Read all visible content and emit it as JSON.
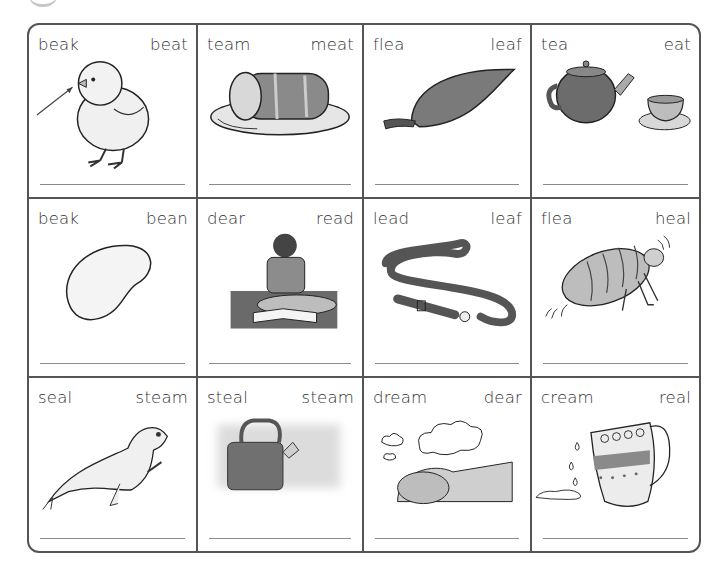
{
  "worksheet": {
    "cells": [
      {
        "left_word": "beak",
        "right_word": "beat",
        "picture": "chick-with-arrow-to-beak"
      },
      {
        "left_word": "team",
        "right_word": "meat",
        "picture": "meat-joint-on-plate"
      },
      {
        "left_word": "flea",
        "right_word": "leaf",
        "picture": "leaf"
      },
      {
        "left_word": "tea",
        "right_word": "eat",
        "picture": "teapot-and-cup"
      },
      {
        "left_word": "beak",
        "right_word": "bean",
        "picture": "bean"
      },
      {
        "left_word": "dear",
        "right_word": "read",
        "picture": "child-reading-book"
      },
      {
        "left_word": "lead",
        "right_word": "leaf",
        "picture": "dog-lead"
      },
      {
        "left_word": "flea",
        "right_word": "heal",
        "picture": "flea"
      },
      {
        "left_word": "seal",
        "right_word": "steam",
        "picture": "seal"
      },
      {
        "left_word": "steal",
        "right_word": "steam",
        "picture": "steaming-kettle"
      },
      {
        "left_word": "dream",
        "right_word": "dear",
        "picture": "sleeping-child-dreaming"
      },
      {
        "left_word": "cream",
        "right_word": "real",
        "picture": "cream-jug-pouring"
      }
    ]
  },
  "colors": {
    "border": "#555555",
    "writing_line": "#8a8a8a",
    "text": "#333333"
  }
}
